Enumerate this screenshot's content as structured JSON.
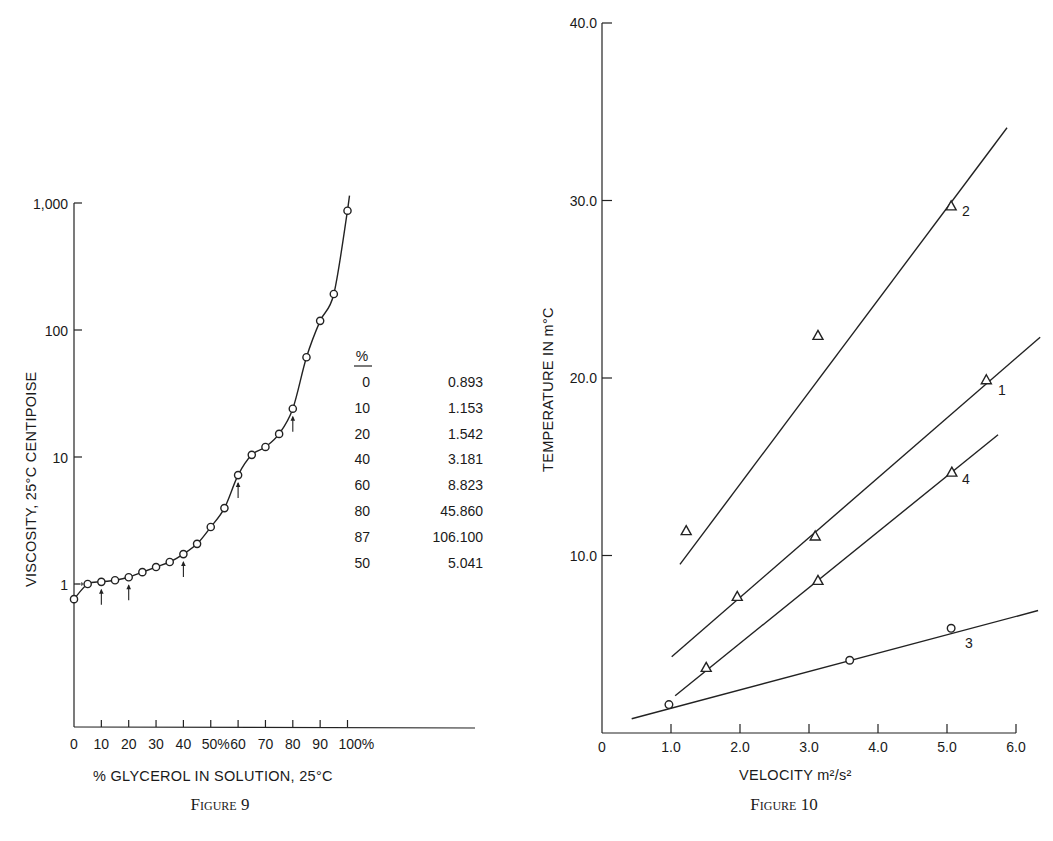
{
  "figure9": {
    "caption": "Figure 9",
    "xlabel": "% GLYCEROL IN SOLUTION, 25°C",
    "ylabel": "VISCOSITY, 25°C CENTIPOISE",
    "xticks": [
      "0",
      "10",
      "20",
      "30",
      "40",
      "50%",
      "60",
      "70",
      "80",
      "90",
      "100%"
    ],
    "yticks": [
      "1",
      "10",
      "100",
      "1,000"
    ],
    "table": {
      "header": "%",
      "rows": [
        {
          "pct": "0",
          "value": "0.893"
        },
        {
          "pct": "10",
          "value": "1.153"
        },
        {
          "pct": "20",
          "value": "1.542"
        },
        {
          "pct": "40",
          "value": "3.181"
        },
        {
          "pct": "60",
          "value": "8.823"
        },
        {
          "pct": "80",
          "value": "45.860"
        },
        {
          "pct": "87",
          "value": "106.100"
        },
        {
          "pct": "50",
          "value": "5.041"
        }
      ]
    }
  },
  "figure10": {
    "caption": "Figure 10",
    "xlabel": "VELOCITY m²/s²",
    "ylabel": "TEMPERATURE IN m°C",
    "xticks": [
      "0",
      "1.0",
      "2.0",
      "3.0",
      "4.0",
      "5.0",
      "6.0"
    ],
    "yticks": [
      "10.0",
      "20.0",
      "30.0",
      "40.0"
    ],
    "line_labels": [
      "1",
      "2",
      "3",
      "4"
    ]
  },
  "chart_data": [
    {
      "type": "line",
      "title": "Figure 9",
      "xlabel": "% GLYCEROL IN SOLUTION, 25°C",
      "ylabel": "VISCOSITY, 25°C CENTIPOISE",
      "yscale": "log",
      "xlim": [
        0,
        100
      ],
      "ylim": [
        0.1,
        1000
      ],
      "grid": false,
      "x_tick_labels": [
        "0",
        "10",
        "20",
        "30",
        "40",
        "50%",
        "60",
        "70",
        "80",
        "90",
        "100%"
      ],
      "y_tick_labels": [
        "1",
        "10",
        "100",
        "1,000"
      ],
      "series": [
        {
          "name": "viscosity",
          "marker": "circle",
          "x": [
            0,
            5,
            10,
            15,
            20,
            25,
            30,
            35,
            40,
            45,
            50,
            55,
            60,
            65,
            70,
            75,
            80,
            85,
            90,
            95,
            100
          ],
          "y": [
            0.76,
            1.0,
            1.04,
            1.07,
            1.13,
            1.24,
            1.36,
            1.49,
            1.72,
            2.07,
            2.81,
            3.96,
            7.2,
            10.4,
            12.0,
            15.2,
            24,
            61,
            118,
            192,
            870
          ]
        }
      ],
      "annotations": {
        "arrows_at_x": [
          10,
          20,
          40,
          60,
          80
        ],
        "table_header": "%",
        "table": [
          [
            "0",
            "0.893"
          ],
          [
            "10",
            "1.153"
          ],
          [
            "20",
            "1.542"
          ],
          [
            "40",
            "3.181"
          ],
          [
            "60",
            "8.823"
          ],
          [
            "80",
            "45.860"
          ],
          [
            "87",
            "106.100"
          ],
          [
            "50",
            "5.041"
          ]
        ]
      }
    },
    {
      "type": "scatter",
      "title": "Figure 10",
      "xlabel": "VELOCITY m²/s²",
      "ylabel": "TEMPERATURE IN m°C",
      "xlim": [
        0,
        6.0
      ],
      "ylim": [
        0,
        40.0
      ],
      "grid": false,
      "x_tick_labels": [
        "0",
        "1.0",
        "2.0",
        "3.0",
        "4.0",
        "5.0",
        "6.0"
      ],
      "y_tick_labels": [
        "10.0",
        "20.0",
        "30.0",
        "40.0"
      ],
      "series": [
        {
          "name": "1",
          "marker": "triangle",
          "x": [
            1.96,
            3.09,
            5.57
          ],
          "y": [
            7.7,
            11.1,
            19.9
          ],
          "fit_line": [
            [
              1.01,
              4.3
            ],
            [
              6.35,
              22.3
            ]
          ]
        },
        {
          "name": "2",
          "marker": "triangle",
          "x": [
            1.22,
            3.13,
            5.06
          ],
          "y": [
            11.4,
            22.4,
            29.7
          ],
          "fit_line": [
            [
              1.13,
              9.5
            ],
            [
              5.87,
              34.1
            ]
          ]
        },
        {
          "name": "3",
          "marker": "circle",
          "x": [
            0.97,
            3.59,
            5.06
          ],
          "y": [
            1.6,
            4.1,
            5.9
          ],
          "fit_line": [
            [
              0.43,
              0.8
            ],
            [
              6.32,
              6.9
            ]
          ]
        },
        {
          "name": "4",
          "marker": "triangle",
          "x": [
            1.51,
            3.13,
            5.07
          ],
          "y": [
            3.7,
            8.6,
            14.7
          ],
          "fit_line": [
            [
              1.06,
              2.1
            ],
            [
              5.74,
              16.8
            ]
          ]
        }
      ]
    }
  ]
}
